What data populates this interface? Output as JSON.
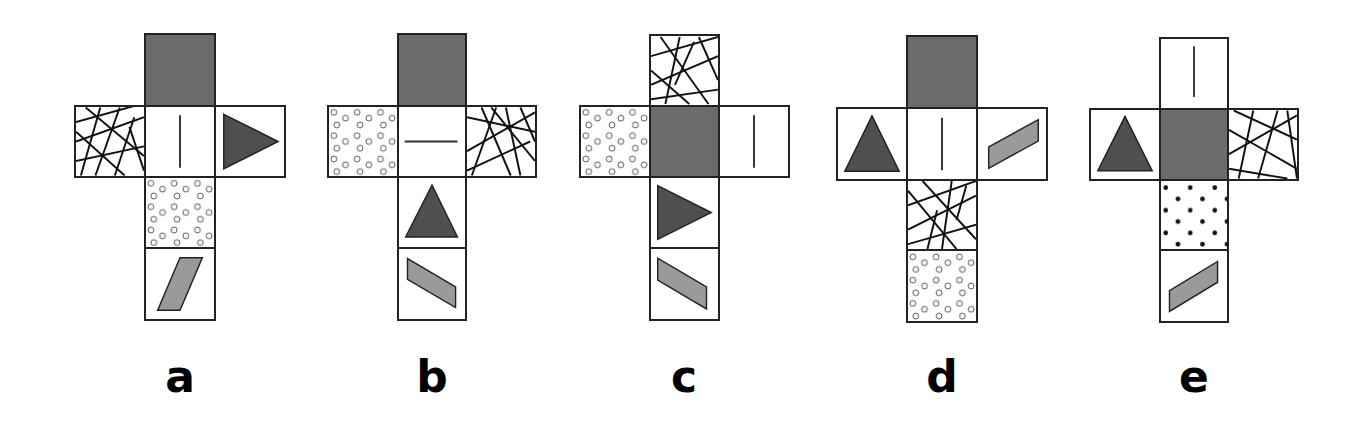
{
  "colors": {
    "dark_gray": "#6b6b6b",
    "triangle": "#4f4f4f",
    "parallelogram": "#9a9a9a",
    "outline": "#222222",
    "background": "#ffffff"
  },
  "legend_face_types": [
    "solid-gray",
    "vertical-line",
    "horizontal-line",
    "cross-hatch",
    "circles",
    "dots",
    "triangle-right",
    "triangle-up",
    "parallelogram"
  ],
  "nets": [
    {
      "label": "a",
      "faces": {
        "top": "solid-gray",
        "left": "cross-hatch",
        "center": "vertical-line",
        "right": "triangle-right",
        "below": "circles",
        "bottom": "parallelogram-steep"
      }
    },
    {
      "label": "b",
      "faces": {
        "top": "solid-gray",
        "left": "circles",
        "center": "horizontal-line",
        "right": "cross-hatch",
        "below": "triangle-up",
        "bottom": "parallelogram-descending"
      }
    },
    {
      "label": "c",
      "faces": {
        "top": "cross-hatch",
        "left": "circles",
        "center": "solid-gray",
        "right": "vertical-line",
        "below": "triangle-right",
        "bottom": "parallelogram-descending"
      }
    },
    {
      "label": "d",
      "faces": {
        "top": "solid-gray",
        "left": "triangle-up",
        "center": "vertical-line",
        "right": "parallelogram-ascending",
        "below": "cross-hatch",
        "bottom": "circles"
      }
    },
    {
      "label": "e",
      "faces": {
        "top": "vertical-line",
        "left": "triangle-up",
        "center": "solid-gray",
        "right": "cross-hatch",
        "below": "dots",
        "bottom": "parallelogram-ascending"
      }
    }
  ]
}
